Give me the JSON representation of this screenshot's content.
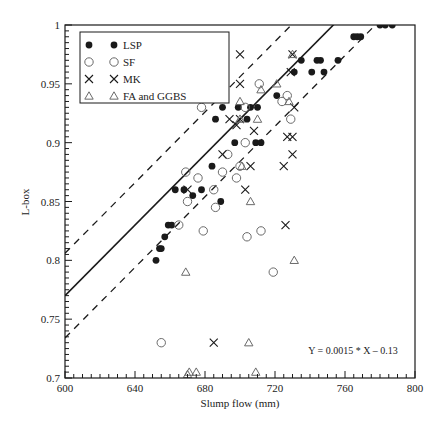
{
  "chart_data": {
    "type": "scatter",
    "title": "",
    "xlabel": "Slump flow (mm)",
    "ylabel": "L-box",
    "xlim": [
      600,
      800
    ],
    "ylim": [
      0.7,
      1.0
    ],
    "x_ticks": [
      600,
      640,
      680,
      720,
      760,
      800
    ],
    "y_ticks": [
      0.7,
      0.75,
      0.8,
      0.85,
      0.9,
      0.95,
      1
    ],
    "x_tick_labels": [
      "600",
      "640",
      "680",
      "720",
      "760",
      "800"
    ],
    "y_tick_labels": [
      "0.7",
      "0.75",
      "0.8",
      "0.85",
      "0.9",
      "0.95",
      "1"
    ],
    "grid": false,
    "legend_position": "upper-left",
    "annotation": "Y = 0.0015 * X – 0.13",
    "fit_line": {
      "slope": 0.0015,
      "intercept": -0.13,
      "style": "solid"
    },
    "band_lines": [
      {
        "slope": 0.0015,
        "intercept": -0.094,
        "style": "dashed"
      },
      {
        "slope": 0.0015,
        "intercept": -0.166,
        "style": "dashed"
      }
    ],
    "series": [
      {
        "name": "LSP",
        "marker": "filled-circle",
        "points": [
          [
            652,
            0.8
          ],
          [
            654,
            0.81
          ],
          [
            655,
            0.81
          ],
          [
            657,
            0.82
          ],
          [
            659,
            0.83
          ],
          [
            661,
            0.83
          ],
          [
            663,
            0.86
          ],
          [
            668,
            0.86
          ],
          [
            673,
            0.855
          ],
          [
            678,
            0.86
          ],
          [
            684,
            0.88
          ],
          [
            686,
            0.92
          ],
          [
            689,
            0.85
          ],
          [
            690,
            0.93
          ],
          [
            697,
            0.9
          ],
          [
            699,
            0.93
          ],
          [
            704,
            0.92
          ],
          [
            706,
            0.93
          ],
          [
            709,
            0.9
          ],
          [
            712,
            0.9
          ],
          [
            710,
            0.93
          ],
          [
            721,
            0.94
          ],
          [
            731,
            0.96
          ],
          [
            735,
            0.97
          ],
          [
            741,
            0.96
          ],
          [
            746,
            0.97
          ],
          [
            748,
            0.96
          ],
          [
            744,
            0.97
          ],
          [
            756,
            0.97
          ],
          [
            765,
            0.99
          ],
          [
            767,
            0.99
          ],
          [
            769,
            0.99
          ],
          [
            780,
            1.0
          ],
          [
            783,
            1.0
          ],
          [
            787,
            1.0
          ]
        ]
      },
      {
        "name": "SF",
        "marker": "open-circle",
        "points": [
          [
            655,
            0.73
          ],
          [
            665,
            0.83
          ],
          [
            669,
            0.875
          ],
          [
            670,
            0.85
          ],
          [
            676,
            0.87
          ],
          [
            678,
            0.93
          ],
          [
            679,
            0.825
          ],
          [
            685,
            0.86
          ],
          [
            690,
            0.875
          ],
          [
            693,
            0.89
          ],
          [
            698,
            0.87
          ],
          [
            700,
            0.88
          ],
          [
            703,
            0.9
          ],
          [
            703,
            0.93
          ],
          [
            704,
            0.82
          ],
          [
            711,
            0.95
          ],
          [
            712,
            0.825
          ],
          [
            719,
            0.79
          ],
          [
            724,
            0.935
          ],
          [
            727,
            0.94
          ],
          [
            729,
            0.92
          ],
          [
            686,
            0.845
          ]
        ]
      },
      {
        "name": "MK",
        "marker": "x",
        "points": [
          [
            670,
            0.86
          ],
          [
            685,
            0.73
          ],
          [
            690,
            0.89
          ],
          [
            694,
            0.92
          ],
          [
            698,
            0.915
          ],
          [
            700,
            0.975
          ],
          [
            700,
            0.95
          ],
          [
            703,
            0.86
          ],
          [
            706,
            0.88
          ],
          [
            708,
            0.91
          ],
          [
            726,
            0.83
          ],
          [
            727,
            0.905
          ],
          [
            730,
            0.975
          ],
          [
            730,
            0.89
          ],
          [
            730,
            0.905
          ],
          [
            731,
            0.93
          ],
          [
            729,
            0.96
          ],
          [
            725,
            0.88
          ],
          [
            700,
            0.92
          ]
        ]
      },
      {
        "name": "FA and GGBS",
        "marker": "open-triangle",
        "points": [
          [
            669,
            0.79
          ],
          [
            670,
            0.703
          ],
          [
            671,
            0.705
          ],
          [
            675,
            0.705
          ],
          [
            700,
            0.935
          ],
          [
            701,
            0.88
          ],
          [
            705,
            0.73
          ],
          [
            706,
            0.85
          ],
          [
            709,
            0.705
          ],
          [
            712,
            0.945
          ],
          [
            721,
            0.95
          ],
          [
            728,
            0.935
          ],
          [
            731,
            0.8
          ],
          [
            730,
            0.975
          ],
          [
            700,
            0.92
          ],
          [
            710,
            0.92
          ]
        ]
      }
    ]
  },
  "legend": {
    "items": [
      {
        "label": "LSP",
        "marker": "filled-circle"
      },
      {
        "label": "SF",
        "marker": "open-circle"
      },
      {
        "label": "MK",
        "marker": "x"
      },
      {
        "label": "FA and GGBS",
        "marker": "open-triangle"
      }
    ]
  },
  "colors": {
    "ink": "#1a1a1a",
    "open_marker": "#6a6a6a",
    "background": "#ffffff"
  }
}
